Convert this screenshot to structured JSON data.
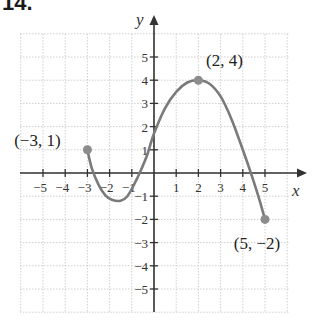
{
  "problem": {
    "number": "14."
  },
  "graph": {
    "x_axis_label": "x",
    "y_axis_label": "y",
    "x_ticks": [
      {
        "v": -5,
        "label": "−5"
      },
      {
        "v": -4,
        "label": "−4"
      },
      {
        "v": -3,
        "label": "−3"
      },
      {
        "v": -2,
        "label": "−2"
      },
      {
        "v": -1,
        "label": "−1"
      },
      {
        "v": 1,
        "label": "1"
      },
      {
        "v": 2,
        "label": "2"
      },
      {
        "v": 3,
        "label": "3"
      },
      {
        "v": 4,
        "label": "4"
      },
      {
        "v": 5,
        "label": "5"
      }
    ],
    "y_ticks": [
      {
        "v": 5,
        "label": "5"
      },
      {
        "v": 4,
        "label": "4"
      },
      {
        "v": 3,
        "label": "3"
      },
      {
        "v": 2,
        "label": "2"
      },
      {
        "v": 1,
        "label": "1"
      },
      {
        "v": -1,
        "label": "−1"
      },
      {
        "v": -2,
        "label": "−2"
      },
      {
        "v": -3,
        "label": "−3"
      },
      {
        "v": -4,
        "label": "−4"
      },
      {
        "v": -5,
        "label": "−5"
      }
    ],
    "xlim": [
      -6,
      6
    ],
    "ylim": [
      -6,
      6
    ],
    "grid": true,
    "curve_color": "#7a7a7a",
    "point_color": "#8c8c8c",
    "axis_color": "#333333",
    "grid_color": "#cfcfcf",
    "curve_points": [
      [
        -3,
        1
      ],
      [
        -2.8,
        0.2
      ],
      [
        -2.5,
        -0.5
      ],
      [
        -2.2,
        -0.95
      ],
      [
        -1.9,
        -1.15
      ],
      [
        -1.5,
        -1.2
      ],
      [
        -1.2,
        -1.0
      ],
      [
        -0.9,
        -0.5
      ],
      [
        -0.6,
        0.1
      ],
      [
        -0.3,
        0.8
      ],
      [
        0,
        1.7
      ],
      [
        0.5,
        2.8
      ],
      [
        1,
        3.5
      ],
      [
        1.5,
        3.9
      ],
      [
        2,
        4
      ],
      [
        2.5,
        3.85
      ],
      [
        3,
        3.3
      ],
      [
        3.5,
        2.3
      ],
      [
        4,
        1.0
      ],
      [
        4.4,
        -0.1
      ],
      [
        4.7,
        -1.0
      ],
      [
        5,
        -2
      ]
    ],
    "labeled_points": [
      {
        "x": -3,
        "y": 1,
        "label": "(−3, 1)"
      },
      {
        "x": 2,
        "y": 4,
        "label": "(2, 4)"
      },
      {
        "x": 5,
        "y": -2,
        "label": "(5, −2)"
      }
    ]
  }
}
